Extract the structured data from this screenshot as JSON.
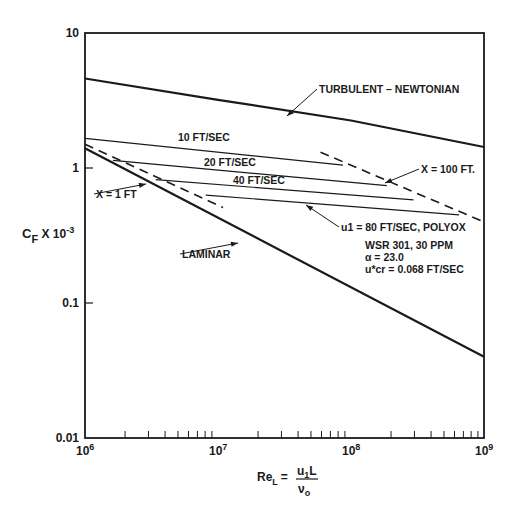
{
  "chart_data": {
    "type": "line",
    "title": "",
    "xlabel": "Re_L = u1 L / ν0",
    "ylabel": "C_F X 10^-3",
    "xscale": "log",
    "yscale": "log",
    "xlim": [
      1000000,
      1000000000
    ],
    "ylim": [
      0.01,
      10
    ],
    "grid": false,
    "legend": "none (inline annotations)",
    "x_ticks": [
      {
        "value": 1000000,
        "base": "10",
        "exp": "6"
      },
      {
        "value": 10000000,
        "base": "10",
        "exp": "7"
      },
      {
        "value": 100000000,
        "base": "10",
        "exp": "8"
      },
      {
        "value": 1000000000,
        "base": "10",
        "exp": "9"
      }
    ],
    "y_ticks": [
      {
        "value": 10,
        "label": "10"
      },
      {
        "value": 1,
        "label": "1"
      },
      {
        "value": 0.1,
        "label": "0.1"
      },
      {
        "value": 0.01,
        "label": "0.01"
      }
    ],
    "series": [
      {
        "name": "TURBULENT - NEWTONIAN",
        "style": "solid",
        "width": 2.2,
        "x": [
          1000000,
          10000000,
          100000000,
          1000000000
        ],
        "y": [
          4.6,
          3.2,
          2.25,
          1.43
        ]
      },
      {
        "name": "LAMINAR",
        "style": "solid",
        "width": 2.2,
        "x": [
          1000000,
          1000000000
        ],
        "y": [
          1.4,
          0.04
        ]
      },
      {
        "name": "10 FT/SEC",
        "style": "solid",
        "width": 1.2,
        "x": [
          1000000,
          87000000
        ],
        "y": [
          1.66,
          1.05
        ]
      },
      {
        "name": "20 FT/SEC",
        "style": "solid",
        "width": 1.2,
        "x": [
          1620000,
          186000000
        ],
        "y": [
          1.14,
          0.74
        ]
      },
      {
        "name": "40 FT/SEC",
        "style": "solid",
        "width": 1.2,
        "x": [
          3400000,
          295000000
        ],
        "y": [
          0.82,
          0.58
        ]
      },
      {
        "name": "u1 = 80 FT/SEC, POLYOX",
        "style": "solid",
        "width": 1.2,
        "x": [
          8100000,
          650000000
        ],
        "y": [
          0.63,
          0.45
        ]
      },
      {
        "name": "X = 1 FT",
        "style": "dashed",
        "width": 1.6,
        "x": [
          1000000,
          10900000
        ],
        "y": [
          1.5,
          0.51
        ]
      },
      {
        "name": "X = 100 FT.",
        "style": "dashed",
        "width": 1.6,
        "x": [
          59000000,
          990000000
        ],
        "y": [
          1.31,
          0.4
        ]
      }
    ],
    "annotations": [
      {
        "text": "TURBULENT – NEWTONIAN",
        "x": 319,
        "y": 93,
        "arrow_to": [
          287,
          116
        ]
      },
      {
        "text": "10 FT/SEC",
        "x": 178,
        "y": 141
      },
      {
        "text": "20 FT/SEC",
        "x": 204,
        "y": 166
      },
      {
        "text": "40 FT/SEC",
        "x": 233,
        "y": 184
      },
      {
        "text": "X = 100 FT.",
        "x": 421,
        "y": 173,
        "arrow_to": [
          385,
          183
        ]
      },
      {
        "text": "X = 1 FT",
        "x": 96,
        "y": 198,
        "arrow_to": [
          146,
          184
        ]
      },
      {
        "text": "LAMINAR",
        "x": 182,
        "y": 258,
        "arrow_to": [
          238,
          243
        ]
      },
      {
        "text": "u1 = 80 FT/SEC, POLYOX",
        "x": 341,
        "y": 231,
        "arrow_to": [
          306,
          205
        ]
      },
      {
        "text": "WSR 301, 30 PPM",
        "x": 365,
        "y": 249
      },
      {
        "text": "α = 23.0",
        "x": 365,
        "y": 261
      },
      {
        "text": "u*cr = 0.068 FT/SEC",
        "x": 365,
        "y": 273
      }
    ]
  },
  "axis": {
    "y_title_main": "C",
    "y_title_sub": "F",
    "y_title_rest": " X 10",
    "y_title_sup": "-3",
    "x_title_lhs": "Re",
    "x_title_lhs_sub": "L",
    "x_title_eq": "=",
    "x_title_num": "u",
    "x_title_num_sub": "1",
    "x_title_num_rest": "L",
    "x_title_den": "ν",
    "x_title_den_sub": "o"
  },
  "colors": {
    "ink": "#1a1a1a",
    "background": "#ffffff"
  }
}
